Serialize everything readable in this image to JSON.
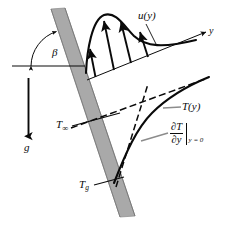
{
  "figure": {
    "name": "inclined-plate-natural-convection-boundary-layer",
    "width": 227,
    "height": 228,
    "background_color": "#ffffff",
    "line_color": "#0a0a0a",
    "plate_fill_color": "#a9a9a9",
    "plate_edge_color": "#6e6e6e",
    "leader_color": "#808080"
  },
  "labels": {
    "angle": "β",
    "gravity": "g",
    "axis_y": "y",
    "velocity_profile": "u(y)",
    "temperature_profile": "T(y)",
    "free_stream_temperature": "T",
    "free_stream_temperature_sub": "∞",
    "wall_temperature": "T",
    "wall_temperature_sub": "g",
    "derivative_numerator": "∂T",
    "derivative_denominator": "∂y",
    "derivative_evaluated_at": "y = 0"
  },
  "elements": {
    "plate": {
      "name": "inclined-flat-plate",
      "description": "thick gray band inclined from upper-left to lower-right"
    },
    "gravity_arrow": {
      "name": "gravity-vector-arrow",
      "direction": "down"
    },
    "y_axis_arrow": {
      "name": "y-axis-arrow",
      "direction": "up-right"
    },
    "angle_arc": {
      "name": "inclination-angle-arc"
    },
    "horizontal_reference": {
      "name": "horizontal-reference-line"
    },
    "velocity_vectors": {
      "name": "velocity-profile-vectors",
      "count": 4
    },
    "velocity_curve": {
      "name": "velocity-profile-curve"
    },
    "temperature_curve": {
      "name": "temperature-profile-curve"
    },
    "asymptote_dashed": {
      "name": "free-stream-temperature-asymptote-dashed-line"
    },
    "tangent_dashed": {
      "name": "wall-temperature-gradient-tangent-dashed-line"
    }
  }
}
